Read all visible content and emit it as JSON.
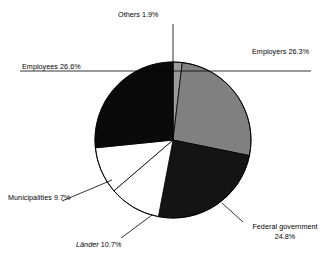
{
  "chart_data": {
    "type": "pie",
    "title": "",
    "subtitle": "",
    "xlabel": "",
    "ylabel": "",
    "legend_position": "none",
    "grid": false,
    "units": "percent",
    "start_angle_deg": 0,
    "direction": "clockwise",
    "categories": [
      "Others",
      "Employers",
      "Federal government",
      "Länder",
      "Municipalities",
      "Employees"
    ],
    "values": [
      1.9,
      26.3,
      24.8,
      10.7,
      9.7,
      26.6
    ],
    "slices": [
      {
        "name": "Others",
        "value": 1.9,
        "label": "Others 1.9%",
        "value_label": "1.9%",
        "color": "#9a9a9a",
        "stroke": "#000000",
        "italic": false
      },
      {
        "name": "Employers",
        "value": 26.3,
        "label": "Employers 26.3%",
        "value_label": "26.3%",
        "color": "#808080",
        "stroke": "#000000",
        "italic": false
      },
      {
        "name": "Federal government",
        "value": 24.8,
        "label": "Federal government 24.8%",
        "value_label": "24.8%",
        "color": "#141414",
        "stroke": "#000000",
        "italic": false
      },
      {
        "name": "Länder",
        "value": 10.7,
        "label": "Länder 10.7%",
        "value_label": "10.7%",
        "color": "#ffffff",
        "stroke": "#000000",
        "italic": true
      },
      {
        "name": "Municipalities",
        "value": 9.7,
        "label": "Municipalities 9.7%",
        "value_label": "9.7%",
        "color": "#ffffff",
        "stroke": "#000000",
        "italic": false
      },
      {
        "name": "Employees",
        "value": 26.6,
        "label": "Employees 26.6%",
        "value_label": "26.6%",
        "color": "#0a0a0a",
        "stroke": "#000000",
        "italic": false
      }
    ]
  },
  "labels": {
    "others": "Others 1.9%",
    "employers": "Employers 26.3%",
    "employees": "Employees 26.6%",
    "municipalities": "Municipalities 9.7%",
    "laender_name": "Länder",
    "laender_value": "10.7%",
    "federal_name": "Federal government",
    "federal_value": "24.8%"
  },
  "colors": {
    "background": "#ffffff",
    "text": "#000000",
    "outline": "#000000",
    "slice_light_gray": "#9a9a9a",
    "slice_gray": "#808080",
    "slice_black": "#0a0a0a",
    "slice_dark": "#141414",
    "slice_white": "#ffffff"
  }
}
